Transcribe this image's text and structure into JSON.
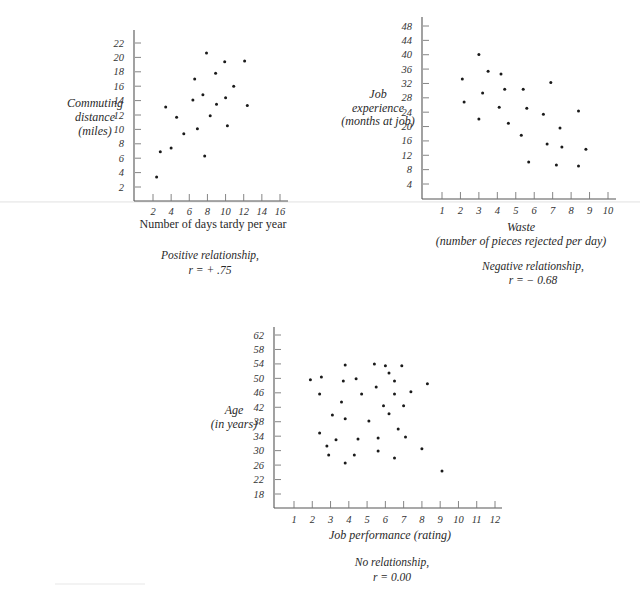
{
  "chart_data": [
    {
      "id": "positive",
      "type": "scatter",
      "title": "",
      "caption_line1": "Positive relationship,",
      "caption_line2": "r = + .75",
      "r": 0.75,
      "xlabel": "Number of days tardy per year",
      "ylabel_lines": [
        "Commuting",
        "distance",
        "(miles)"
      ],
      "x_ticks": [
        2,
        4,
        6,
        8,
        10,
        12,
        14,
        16
      ],
      "y_ticks": [
        2,
        4,
        6,
        8,
        10,
        12,
        14,
        16,
        18,
        20,
        22
      ],
      "xlim": [
        0,
        17
      ],
      "ylim": [
        0,
        24
      ],
      "grid": false,
      "legend": null,
      "layout": {
        "axis_x": 134,
        "axis_top": 30,
        "baseline": 201,
        "axis_right": 288,
        "x_ref": [
          2,
          153,
          16,
          280
        ],
        "y_ref": [
          2,
          187,
          22,
          43
        ],
        "xlabel_y": 228,
        "ylabel_x": 95,
        "ylabel_y": [
          107,
          121,
          135
        ],
        "caption_x": 210,
        "caption_y": [
          259,
          274
        ],
        "xtick_label_y": 215
      },
      "points": [
        {
          "x": 2.4,
          "y": 3.4
        },
        {
          "x": 2.8,
          "y": 6.9
        },
        {
          "x": 3.4,
          "y": 13.1
        },
        {
          "x": 4.0,
          "y": 7.4
        },
        {
          "x": 4.6,
          "y": 11.7
        },
        {
          "x": 5.4,
          "y": 9.4
        },
        {
          "x": 6.4,
          "y": 14.1
        },
        {
          "x": 6.6,
          "y": 17.0
        },
        {
          "x": 6.9,
          "y": 10.1
        },
        {
          "x": 7.5,
          "y": 14.8
        },
        {
          "x": 7.7,
          "y": 6.3
        },
        {
          "x": 7.9,
          "y": 20.6
        },
        {
          "x": 8.3,
          "y": 11.9
        },
        {
          "x": 8.9,
          "y": 17.8
        },
        {
          "x": 9.0,
          "y": 13.5
        },
        {
          "x": 9.9,
          "y": 19.4
        },
        {
          "x": 10.0,
          "y": 14.4
        },
        {
          "x": 10.2,
          "y": 10.5
        },
        {
          "x": 10.9,
          "y": 16.0
        },
        {
          "x": 12.1,
          "y": 19.5
        },
        {
          "x": 12.4,
          "y": 13.3
        }
      ]
    },
    {
      "id": "negative",
      "type": "scatter",
      "title": "",
      "caption_line1": "Negative relationship,",
      "caption_line2": "r = − 0.68",
      "r": -0.68,
      "xlabel": "Waste",
      "xlabel_line2": "(number of pieces rejected per day)",
      "ylabel_lines": [
        "Job",
        "experience",
        "(months at job)"
      ],
      "x_ticks": [
        1,
        2,
        3,
        4,
        5,
        6,
        7,
        8,
        9,
        10
      ],
      "y_ticks": [
        4,
        8,
        12,
        16,
        20,
        24,
        28,
        32,
        36,
        40,
        44,
        48
      ],
      "xlim": [
        0,
        10.5
      ],
      "ylim": [
        0,
        50
      ],
      "grid": false,
      "legend": null,
      "layout": {
        "axis_x": 422,
        "axis_top": 17,
        "baseline": 199,
        "axis_right": 616,
        "x_ref": [
          1,
          442,
          10,
          608
        ],
        "y_ref": [
          4,
          184,
          48,
          26
        ],
        "xlabel_y": 231,
        "ylabel_x": 378,
        "ylabel_y": [
          98,
          112,
          125
        ],
        "caption_x": 533,
        "caption_y": [
          270,
          284
        ],
        "xtick_label_y": 214
      },
      "points": [
        {
          "x": 2.1,
          "y": 33.2
        },
        {
          "x": 2.2,
          "y": 26.8
        },
        {
          "x": 3.0,
          "y": 40.1
        },
        {
          "x": 3.2,
          "y": 29.3
        },
        {
          "x": 3.0,
          "y": 22.1
        },
        {
          "x": 3.5,
          "y": 35.4
        },
        {
          "x": 4.2,
          "y": 34.6
        },
        {
          "x": 4.4,
          "y": 30.4
        },
        {
          "x": 4.1,
          "y": 25.4
        },
        {
          "x": 4.6,
          "y": 20.9
        },
        {
          "x": 5.4,
          "y": 30.4
        },
        {
          "x": 5.6,
          "y": 25.1
        },
        {
          "x": 5.3,
          "y": 17.6
        },
        {
          "x": 5.7,
          "y": 10.1
        },
        {
          "x": 6.5,
          "y": 23.4
        },
        {
          "x": 6.9,
          "y": 32.3
        },
        {
          "x": 6.7,
          "y": 15.1
        },
        {
          "x": 7.4,
          "y": 19.6
        },
        {
          "x": 7.5,
          "y": 14.3
        },
        {
          "x": 7.2,
          "y": 9.3
        },
        {
          "x": 8.4,
          "y": 24.3
        },
        {
          "x": 8.8,
          "y": 13.7
        },
        {
          "x": 8.4,
          "y": 9.0
        }
      ]
    },
    {
      "id": "none",
      "type": "scatter",
      "title": "",
      "caption_line1": "No relationship,",
      "caption_line2": "r = 0.00",
      "r": 0.0,
      "xlabel": "Job performance (rating)",
      "ylabel_lines": [
        "Age",
        "(in years)"
      ],
      "x_ticks": [
        1,
        2,
        3,
        4,
        5,
        6,
        7,
        8,
        9,
        10,
        11,
        12
      ],
      "y_ticks": [
        18,
        22,
        26,
        30,
        34,
        38,
        42,
        46,
        50,
        54,
        58,
        62
      ],
      "xlim": [
        0,
        12.5
      ],
      "ylim": [
        14,
        64
      ],
      "grid": false,
      "legend": null,
      "layout": {
        "axis_x": 274,
        "axis_top": 327,
        "baseline": 508,
        "axis_right": 502,
        "x_ref": [
          1,
          294,
          12,
          495
        ],
        "y_ref": [
          18,
          494,
          62,
          335
        ],
        "xlabel_y": 539,
        "ylabel_x": 234,
        "ylabel_y": [
          414,
          428
        ],
        "caption_x": 392,
        "caption_y": [
          566,
          581
        ],
        "xtick_label_y": 523
      },
      "points": [
        {
          "x": 1.9,
          "y": 49.6
        },
        {
          "x": 2.5,
          "y": 50.4
        },
        {
          "x": 2.4,
          "y": 45.7
        },
        {
          "x": 2.4,
          "y": 34.9
        },
        {
          "x": 2.8,
          "y": 31.3
        },
        {
          "x": 2.9,
          "y": 28.8
        },
        {
          "x": 3.1,
          "y": 39.9
        },
        {
          "x": 3.3,
          "y": 33.0
        },
        {
          "x": 3.6,
          "y": 43.5
        },
        {
          "x": 3.7,
          "y": 49.3
        },
        {
          "x": 3.8,
          "y": 53.7
        },
        {
          "x": 3.8,
          "y": 38.8
        },
        {
          "x": 3.8,
          "y": 26.6
        },
        {
          "x": 4.3,
          "y": 28.8
        },
        {
          "x": 4.4,
          "y": 49.9
        },
        {
          "x": 4.5,
          "y": 33.2
        },
        {
          "x": 4.7,
          "y": 45.7
        },
        {
          "x": 5.1,
          "y": 38.2
        },
        {
          "x": 5.4,
          "y": 54.0
        },
        {
          "x": 5.5,
          "y": 47.6
        },
        {
          "x": 5.6,
          "y": 33.5
        },
        {
          "x": 5.6,
          "y": 29.9
        },
        {
          "x": 5.9,
          "y": 42.4
        },
        {
          "x": 6.0,
          "y": 53.5
        },
        {
          "x": 6.2,
          "y": 51.5
        },
        {
          "x": 6.2,
          "y": 40.2
        },
        {
          "x": 6.5,
          "y": 45.7
        },
        {
          "x": 6.5,
          "y": 49.3
        },
        {
          "x": 6.5,
          "y": 28.0
        },
        {
          "x": 6.7,
          "y": 36.0
        },
        {
          "x": 6.9,
          "y": 53.5
        },
        {
          "x": 7.0,
          "y": 42.4
        },
        {
          "x": 7.1,
          "y": 33.8
        },
        {
          "x": 7.4,
          "y": 46.3
        },
        {
          "x": 8.0,
          "y": 30.5
        },
        {
          "x": 8.3,
          "y": 48.5
        },
        {
          "x": 9.1,
          "y": 24.4
        }
      ]
    }
  ]
}
